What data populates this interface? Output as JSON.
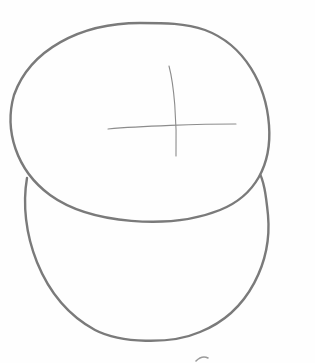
{
  "image": {
    "description": "Pencil sketch of two overlapping ovals (head and body guide shapes) with a construction cross on the upper oval",
    "background_color": "#fefefe",
    "stroke_color": "#7a7a7a",
    "guide_color": "#8c8c8c"
  },
  "shapes": {
    "upper_oval": {
      "label": "upper oval"
    },
    "lower_oval": {
      "label": "lower oval"
    },
    "cross_vertical": {
      "label": "vertical guide line"
    },
    "cross_horizontal": {
      "label": "horizontal guide line"
    }
  }
}
